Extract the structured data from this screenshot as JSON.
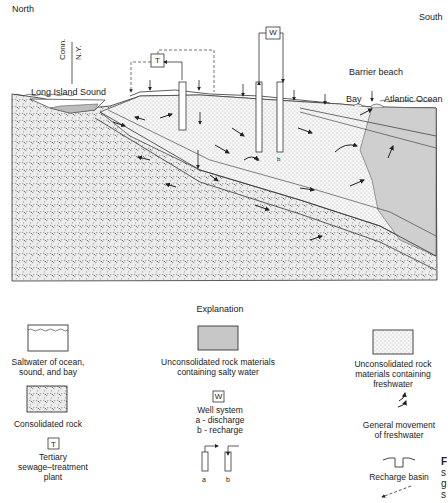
{
  "diagram": {
    "orientation": {
      "left": "North",
      "right": "South"
    },
    "boundary_label": {
      "upper": "Conn.",
      "lower": "N.Y."
    },
    "labels": {
      "long_island_sound": "Long Island Sound",
      "barrier_beach": "Barrier beach",
      "bay": "Bay",
      "atlantic_ocean": "Atlantic Ocean",
      "well_box": "W",
      "treatment_box": "T",
      "well_a": "a",
      "well_b": "b"
    }
  },
  "explanation": {
    "title": "Explanation",
    "items": [
      {
        "id": "saltwater",
        "label_lines": [
          "Saltwater of ocean,",
          "sound, and bay"
        ],
        "icon": "saltwater-swatch"
      },
      {
        "id": "salty_unconsolidated",
        "label_lines": [
          "Unconsolidated rock materials",
          "containing salty water"
        ],
        "icon": "salty-rock-swatch"
      },
      {
        "id": "fresh_unconsolidated",
        "label_lines": [
          "Unconsolidated rock",
          "materials containing",
          "freshwater"
        ],
        "icon": "fresh-rock-swatch"
      },
      {
        "id": "consolidated",
        "label_lines": [
          "Consolidated rock"
        ],
        "icon": "consolidated-rock-swatch"
      },
      {
        "id": "well_system",
        "box": "W",
        "label_lines": [
          "Well system",
          "a - discharge",
          "b - recharge"
        ],
        "sub_labels": [
          "a",
          "b"
        ],
        "icon": "well-system-icon"
      },
      {
        "id": "freshwater_movement",
        "label_lines": [
          "General movement",
          "of freshwater"
        ],
        "icon": "freshwater-movement-arrows-icon"
      },
      {
        "id": "treatment_plant",
        "box": "T",
        "label_lines": [
          "Tertiary",
          "sewage–treatment",
          "plant"
        ],
        "icon": "treatment-plant-icon"
      },
      {
        "id": "recharge_basin",
        "label_lines": [
          "Recharge basin"
        ],
        "icon": "recharge-basin-icon"
      }
    ],
    "clipped_right_text": [
      "F",
      "s",
      "g",
      "s"
    ]
  }
}
